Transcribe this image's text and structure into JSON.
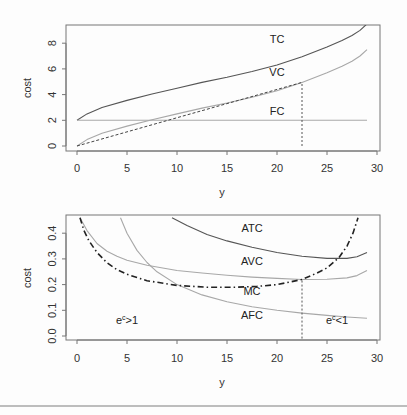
{
  "colors": {
    "dark_curve": "#555555",
    "light_curve": "#a8a8a8",
    "mc_curve": "#222222",
    "frame": "#777777",
    "text": "#333333"
  },
  "chart_data": [
    {
      "type": "line",
      "title": "",
      "xlabel": "y",
      "ylabel": "cost",
      "xlim": [
        -1,
        30.3
      ],
      "ylim": [
        -0.3,
        9.3
      ],
      "xticks": [
        0,
        5,
        10,
        15,
        20,
        25,
        30
      ],
      "xtick_labels": [
        "0",
        "5",
        "10",
        "15",
        "20",
        "25",
        "30"
      ],
      "yticks": [
        0,
        2,
        4,
        6,
        8
      ],
      "ytick_labels": [
        "0",
        "2",
        "4",
        "6",
        "8"
      ],
      "grid": false,
      "legend": "none",
      "x": [
        0,
        1,
        2.5,
        5,
        7.5,
        10,
        12.5,
        15,
        17.5,
        20,
        22.5,
        25,
        26.5,
        27.5,
        28.3,
        29
      ],
      "series": [
        {
          "name": "TC",
          "style": "solid",
          "color": "dark",
          "values": [
            2.0,
            2.5,
            3.0,
            3.55,
            4.05,
            4.5,
            4.95,
            5.35,
            5.8,
            6.3,
            6.95,
            7.7,
            8.2,
            8.6,
            9.0,
            9.5
          ]
        },
        {
          "name": "VC",
          "style": "solid",
          "color": "light",
          "values": [
            0.0,
            0.5,
            1.0,
            1.55,
            2.05,
            2.5,
            2.95,
            3.35,
            3.8,
            4.3,
            4.95,
            5.7,
            6.2,
            6.6,
            7.0,
            7.5
          ]
        },
        {
          "name": "FC",
          "style": "solid",
          "color": "light",
          "values": [
            2,
            2,
            2,
            2,
            2,
            2,
            2,
            2,
            2,
            2,
            2,
            2,
            2,
            2,
            2,
            2
          ]
        }
      ],
      "ray_from_origin": {
        "x_end": 22.5,
        "y_end": 4.95,
        "style": "dashed"
      },
      "vertical_marker": {
        "x": 22.5,
        "y_from": 0,
        "y_to": 4.95,
        "style": "dotted"
      },
      "annotations": [
        {
          "text": "TC",
          "x": 20,
          "y": 8.0
        },
        {
          "text": "VC",
          "x": 20,
          "y": 5.45
        },
        {
          "text": "FC",
          "x": 20,
          "y": 2.4
        }
      ]
    },
    {
      "type": "line",
      "title": "",
      "xlabel": "y",
      "ylabel": "cost",
      "xlim": [
        -1,
        30.3
      ],
      "ylim": [
        -0.016,
        0.46
      ],
      "xticks": [
        0,
        5,
        10,
        15,
        20,
        25,
        30
      ],
      "xtick_labels": [
        "0",
        "5",
        "10",
        "15",
        "20",
        "25",
        "30"
      ],
      "yticks": [
        0.0,
        0.1,
        0.2,
        0.3,
        0.4
      ],
      "ytick_labels": [
        "0.0",
        "0.1",
        "0.2",
        "0.3",
        "0.4"
      ],
      "grid": false,
      "legend": "none",
      "series": [
        {
          "name": "ATC",
          "style": "solid",
          "color": "dark",
          "x": [
            9.5,
            11,
            13,
            15,
            17.5,
            20,
            22.5,
            25,
            27,
            28,
            29
          ],
          "values": [
            0.46,
            0.43,
            0.395,
            0.37,
            0.345,
            0.325,
            0.31,
            0.302,
            0.302,
            0.308,
            0.325
          ]
        },
        {
          "name": "AVC",
          "style": "solid",
          "color": "light",
          "x": [
            0.3,
            1,
            2,
            3,
            4,
            5,
            7,
            10,
            12.5,
            15,
            17.5,
            20,
            22.5,
            25,
            27,
            28,
            29
          ],
          "values": [
            0.46,
            0.41,
            0.36,
            0.33,
            0.31,
            0.295,
            0.275,
            0.255,
            0.245,
            0.236,
            0.229,
            0.224,
            0.22,
            0.221,
            0.226,
            0.235,
            0.255
          ]
        },
        {
          "name": "AFC",
          "style": "solid",
          "color": "light",
          "x": [
            4.35,
            5,
            6,
            7,
            8,
            10,
            12.5,
            15,
            17.5,
            20,
            22.5,
            25,
            27,
            29
          ],
          "values": [
            0.46,
            0.4,
            0.333,
            0.286,
            0.25,
            0.2,
            0.16,
            0.133,
            0.114,
            0.1,
            0.089,
            0.08,
            0.074,
            0.069
          ]
        },
        {
          "name": "MC",
          "style": "dashdot",
          "color": "mc",
          "x": [
            0.3,
            0.7,
            1.2,
            2,
            3,
            4,
            5,
            7,
            10,
            13,
            16,
            18,
            20,
            22.5,
            24,
            25,
            26.2,
            27,
            27.6,
            28.1
          ],
          "values": [
            0.46,
            0.41,
            0.37,
            0.325,
            0.285,
            0.258,
            0.24,
            0.215,
            0.197,
            0.19,
            0.19,
            0.193,
            0.2,
            0.22,
            0.245,
            0.265,
            0.305,
            0.35,
            0.4,
            0.46
          ]
        }
      ],
      "vertical_marker": {
        "x": 22.5,
        "y_from": -0.01,
        "y_to": 0.22,
        "style": "dotted"
      },
      "annotations": [
        {
          "text": "ATC",
          "x": 17.5,
          "y": 0.405
        },
        {
          "text": "AVC",
          "x": 17.5,
          "y": 0.275
        },
        {
          "text": "MC",
          "x": 17.5,
          "y": 0.16
        },
        {
          "text": "AFC",
          "x": 17.5,
          "y": 0.065
        },
        {
          "text": "e",
          "sup": "c",
          "rest": ">1",
          "x": 5,
          "y": 0.045
        },
        {
          "text": "e",
          "sup": "c",
          "rest": "<1",
          "x": 26,
          "y": 0.045
        }
      ]
    }
  ]
}
